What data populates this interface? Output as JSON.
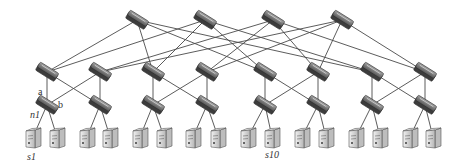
{
  "diagram": {
    "type": "fat-tree network topology",
    "colors": {
      "link": "#4a4a4a",
      "switch_body": "#6e6e6e",
      "switch_top": "#9a9a9a",
      "switch_edge": "#2e2e2e",
      "server_front": "#c8c8c8",
      "server_side": "#e6e6e6",
      "server_edge": "#555555",
      "label": "#333333"
    },
    "layers": {
      "core": [
        {
          "id": "c1",
          "x": 137,
          "y": 20
        },
        {
          "id": "c2",
          "x": 205,
          "y": 20
        },
        {
          "id": "c3",
          "x": 273,
          "y": 20
        },
        {
          "id": "c4",
          "x": 342,
          "y": 20
        }
      ],
      "aggregation": [
        {
          "id": "a1",
          "x": 47,
          "y": 72
        },
        {
          "id": "a2",
          "x": 100,
          "y": 72
        },
        {
          "id": "a3",
          "x": 153,
          "y": 72
        },
        {
          "id": "a4",
          "x": 207,
          "y": 72
        },
        {
          "id": "a5",
          "x": 265,
          "y": 72
        },
        {
          "id": "a6",
          "x": 318,
          "y": 72
        },
        {
          "id": "a7",
          "x": 372,
          "y": 72
        },
        {
          "id": "a8",
          "x": 425,
          "y": 72
        }
      ],
      "edge": [
        {
          "id": "e1",
          "x": 47,
          "y": 105
        },
        {
          "id": "e2",
          "x": 100,
          "y": 105
        },
        {
          "id": "e3",
          "x": 153,
          "y": 105
        },
        {
          "id": "e4",
          "x": 207,
          "y": 105
        },
        {
          "id": "e5",
          "x": 265,
          "y": 105
        },
        {
          "id": "e6",
          "x": 318,
          "y": 105
        },
        {
          "id": "e7",
          "x": 372,
          "y": 105
        },
        {
          "id": "e8",
          "x": 425,
          "y": 105
        }
      ],
      "servers": [
        {
          "id": "s1",
          "x": 33,
          "y": 139
        },
        {
          "id": "s2",
          "x": 57,
          "y": 139
        },
        {
          "id": "s3",
          "x": 87,
          "y": 139
        },
        {
          "id": "s4",
          "x": 110,
          "y": 139
        },
        {
          "id": "s5",
          "x": 140,
          "y": 139
        },
        {
          "id": "s6",
          "x": 164,
          "y": 139
        },
        {
          "id": "s7",
          "x": 193,
          "y": 139
        },
        {
          "id": "s8",
          "x": 218,
          "y": 139
        },
        {
          "id": "s9",
          "x": 248,
          "y": 139
        },
        {
          "id": "s10",
          "x": 272,
          "y": 139
        },
        {
          "id": "s11",
          "x": 302,
          "y": 139
        },
        {
          "id": "s12",
          "x": 326,
          "y": 139
        },
        {
          "id": "s13",
          "x": 356,
          "y": 139
        },
        {
          "id": "s14",
          "x": 380,
          "y": 139
        },
        {
          "id": "s15",
          "x": 410,
          "y": 139
        },
        {
          "id": "s16",
          "x": 433,
          "y": 139
        }
      ]
    },
    "links": [
      [
        "c1",
        "a1"
      ],
      [
        "c1",
        "a3"
      ],
      [
        "c1",
        "a5"
      ],
      [
        "c1",
        "a7"
      ],
      [
        "c2",
        "a1"
      ],
      [
        "c2",
        "a3"
      ],
      [
        "c2",
        "a5"
      ],
      [
        "c2",
        "a7"
      ],
      [
        "c3",
        "a2"
      ],
      [
        "c3",
        "a4"
      ],
      [
        "c3",
        "a6"
      ],
      [
        "c3",
        "a8"
      ],
      [
        "c4",
        "a2"
      ],
      [
        "c4",
        "a4"
      ],
      [
        "c4",
        "a6"
      ],
      [
        "c4",
        "a8"
      ],
      [
        "a1",
        "e1"
      ],
      [
        "a1",
        "e2"
      ],
      [
        "a2",
        "e1"
      ],
      [
        "a2",
        "e2"
      ],
      [
        "a3",
        "e3"
      ],
      [
        "a3",
        "e4"
      ],
      [
        "a4",
        "e3"
      ],
      [
        "a4",
        "e4"
      ],
      [
        "a5",
        "e5"
      ],
      [
        "a5",
        "e6"
      ],
      [
        "a6",
        "e5"
      ],
      [
        "a6",
        "e6"
      ],
      [
        "a7",
        "e7"
      ],
      [
        "a7",
        "e8"
      ],
      [
        "a8",
        "e7"
      ],
      [
        "a8",
        "e8"
      ],
      [
        "e1",
        "s1"
      ],
      [
        "e1",
        "s2"
      ],
      [
        "e2",
        "s3"
      ],
      [
        "e2",
        "s4"
      ],
      [
        "e3",
        "s5"
      ],
      [
        "e3",
        "s6"
      ],
      [
        "e4",
        "s7"
      ],
      [
        "e4",
        "s8"
      ],
      [
        "e5",
        "s9"
      ],
      [
        "e5",
        "s10"
      ],
      [
        "e6",
        "s11"
      ],
      [
        "e6",
        "s12"
      ],
      [
        "e7",
        "s13"
      ],
      [
        "e7",
        "s14"
      ],
      [
        "e8",
        "s15"
      ],
      [
        "e8",
        "s16"
      ]
    ],
    "labels": [
      {
        "id": "label-a",
        "text": "a",
        "x": 38,
        "y": 95,
        "italic": false
      },
      {
        "id": "label-b",
        "text": "b",
        "x": 58,
        "y": 108,
        "italic": false
      },
      {
        "id": "label-n1",
        "text": "n1",
        "x": 30,
        "y": 118,
        "italic": true
      },
      {
        "id": "label-s1",
        "text": "s1",
        "x": 27,
        "y": 160,
        "italic": true
      },
      {
        "id": "label-s10",
        "text": "s10",
        "x": 265,
        "y": 158,
        "italic": true
      }
    ]
  }
}
